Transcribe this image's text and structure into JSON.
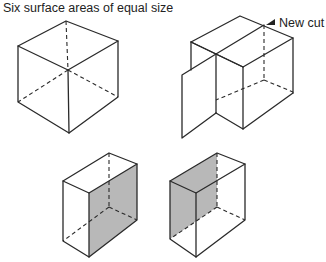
{
  "title": "Six surface areas of equal size",
  "annotation": {
    "label": "New cut",
    "icon": "arrow-pointer-icon"
  },
  "figures": [
    {
      "name": "whole-cube",
      "description": "Cube with six equal faces"
    },
    {
      "name": "cube-with-new-cut",
      "description": "Cube split by a vertical cut plane"
    },
    {
      "name": "half-block-right-face-shaded",
      "shaded_face": "right",
      "shade_color": "#b8b8b8"
    },
    {
      "name": "half-block-left-face-shaded",
      "shaded_face": "left",
      "shade_color": "#b8b8b8"
    }
  ],
  "colors": {
    "line": "#2a2a2a",
    "shade": "#b8b8b8",
    "background": "#ffffff"
  }
}
